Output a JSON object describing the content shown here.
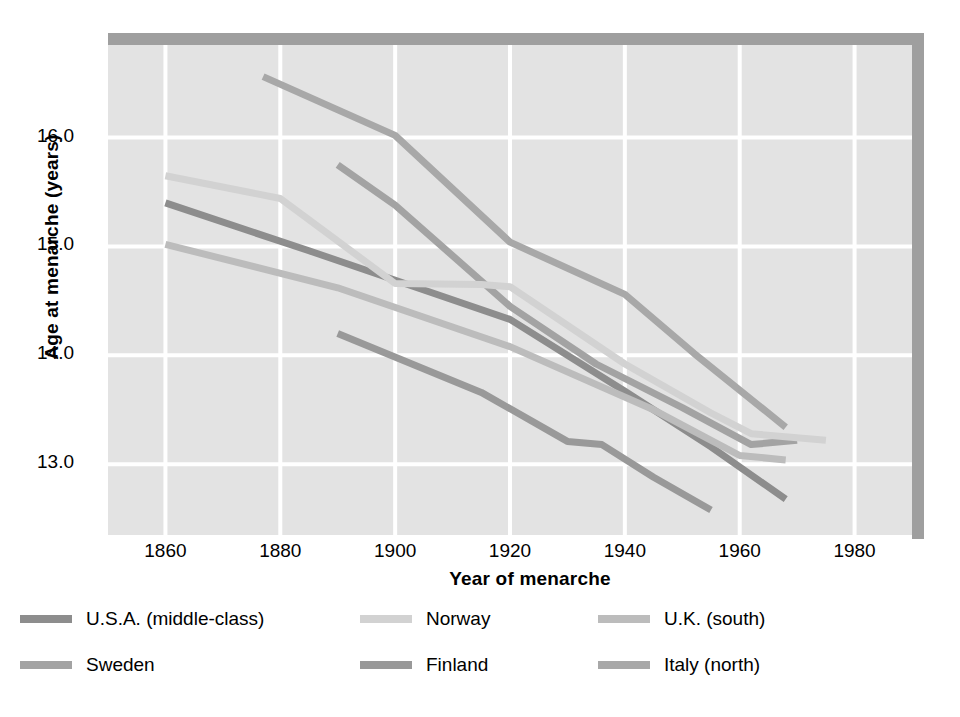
{
  "chart_data": {
    "type": "line",
    "title": "",
    "xlabel": "Year of menarche",
    "ylabel": "Age at menarche (years)",
    "xlim": [
      1850,
      1990
    ],
    "ylim": [
      12.35,
      16.85
    ],
    "xticks": [
      1860,
      1880,
      1900,
      1920,
      1940,
      1960,
      1980
    ],
    "yticks": [
      13.0,
      14.0,
      15.0,
      16.0
    ],
    "ytick_labels": [
      "13.0",
      "14.0",
      "15.0",
      "16.0"
    ],
    "xtick_labels": [
      "1860",
      "1880",
      "1900",
      "1920",
      "1940",
      "1960",
      "1980"
    ],
    "grid": true,
    "legend_position": "below",
    "plot_bg": "#e3e3e3",
    "grid_color": "#ffffff",
    "series": [
      {
        "name": "U.S.A. (middle-class)",
        "color": "#8d8d8d",
        "x": [
          1860,
          1885,
          1905,
          1920,
          1940,
          1955,
          1968
        ],
        "y": [
          15.4,
          14.96,
          14.6,
          14.33,
          13.67,
          13.16,
          12.68
        ]
      },
      {
        "name": "Sweden",
        "color": "#a3a3a3",
        "x": [
          1890,
          1900,
          1920,
          1935,
          1950,
          1962,
          1970
        ],
        "y": [
          15.75,
          15.38,
          14.45,
          13.92,
          13.52,
          13.18,
          13.22
        ]
      },
      {
        "name": "Norway",
        "color": "#d2d2d2",
        "x": [
          1860,
          1880,
          1900,
          1915,
          1920,
          1940,
          1955,
          1962,
          1975
        ],
        "y": [
          15.65,
          15.44,
          14.66,
          14.65,
          14.63,
          13.92,
          13.47,
          13.28,
          13.22
        ]
      },
      {
        "name": "Finland",
        "color": "#999999",
        "x": [
          1890,
          1915,
          1930,
          1936,
          1945,
          1955
        ],
        "y": [
          14.2,
          13.66,
          13.21,
          13.18,
          12.88,
          12.58
        ]
      },
      {
        "name": "U.K. (south)",
        "color": "#bcbcbc",
        "x": [
          1860,
          1890,
          1920,
          1945,
          1960,
          1968
        ],
        "y": [
          15.02,
          14.62,
          14.08,
          13.5,
          13.08,
          13.04
        ]
      },
      {
        "name": "Italy (north)",
        "color": "#a8a8a8",
        "x": [
          1877,
          1900,
          1920,
          1940,
          1952,
          1968
        ],
        "y": [
          16.56,
          16.02,
          15.04,
          14.56,
          14.02,
          13.34
        ]
      }
    ]
  },
  "legend": {
    "items": [
      {
        "label": "U.S.A. (middle-class)",
        "color": "#8d8d8d"
      },
      {
        "label": "Norway",
        "color": "#d2d2d2"
      },
      {
        "label": "U.K. (south)",
        "color": "#bcbcbc"
      },
      {
        "label": "Sweden",
        "color": "#a3a3a3"
      },
      {
        "label": "Finland",
        "color": "#999999"
      },
      {
        "label": "Italy (north)",
        "color": "#a8a8a8"
      }
    ]
  }
}
